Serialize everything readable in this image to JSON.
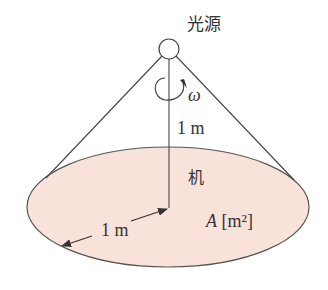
{
  "diagram": {
    "light_source_label": "光源",
    "angular_velocity_symbol": "ω",
    "height_label": "1 m",
    "desk_label": "机",
    "radius_label": "1 m",
    "area_label_symbol": "A",
    "area_label_unit": "[m²]",
    "colors": {
      "ellipse_fill": "#f8e2da",
      "stroke": "#444444",
      "text": "#333333"
    }
  }
}
